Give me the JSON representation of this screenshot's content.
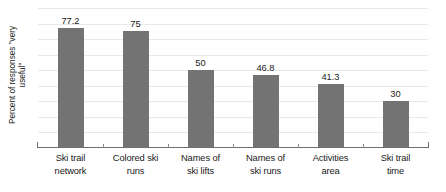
{
  "chart_data": {
    "type": "bar",
    "title": "",
    "subtitle": "",
    "xlabel": "",
    "ylabel": "Percent of responses \"very useful\"",
    "ylabel_lines": [
      "Percent of responses \"very",
      "useful\""
    ],
    "categories": [
      "Ski trail network",
      "Colored ski runs",
      "Names of ski lifts",
      "Names of ski runs",
      "Activities area",
      "Ski trail time"
    ],
    "category_lines": [
      [
        "Ski trail",
        "network"
      ],
      [
        "Colored ski",
        "runs"
      ],
      [
        "Names of",
        "ski lifts"
      ],
      [
        "Names of",
        "ski runs"
      ],
      [
        "Activities",
        "area"
      ],
      [
        "Ski trail",
        "time"
      ]
    ],
    "values": [
      77.2,
      75,
      50,
      46.8,
      41.3,
      30
    ],
    "value_labels": [
      "77.2",
      "75",
      "50",
      "46.8",
      "41.3",
      "30"
    ],
    "ylim": [
      0,
      90
    ],
    "grid": true,
    "gridline_values": [
      10,
      20,
      30,
      40,
      50,
      60,
      70,
      80,
      90
    ],
    "legend": null,
    "legend_position": "none",
    "bar_color": "#737373",
    "grid_color": "#e9e9ea",
    "axis_color": "#6f6f6f",
    "text_color": "#1a1a1a",
    "background_color": "#ffffff"
  }
}
